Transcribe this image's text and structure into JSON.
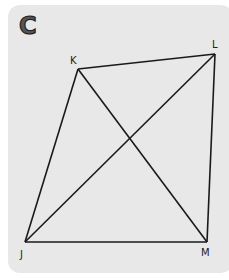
{
  "figure_label": "C",
  "vertices": [
    {
      "name": "K",
      "label": "K"
    },
    {
      "name": "L",
      "label": "L"
    },
    {
      "name": "M",
      "label": "M"
    },
    {
      "name": "J",
      "label": "J"
    }
  ],
  "segments": [
    [
      "K",
      "L"
    ],
    [
      "L",
      "M"
    ],
    [
      "M",
      "J"
    ],
    [
      "J",
      "K"
    ],
    [
      "K",
      "M"
    ],
    [
      "J",
      "L"
    ]
  ],
  "colors": {
    "panel": "#e8e8e8",
    "line": "#1a1a1a"
  }
}
